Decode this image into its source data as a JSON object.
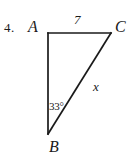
{
  "figure": {
    "problem_number": "4.",
    "shape": "right-triangle",
    "stroke_color": "#1a1a1a",
    "background_color": "#ffffff",
    "vertices": [
      {
        "name": "A",
        "label": "A",
        "x": 48,
        "y": 33,
        "position": "top-left"
      },
      {
        "name": "C",
        "label": "C",
        "x": 111,
        "y": 33,
        "position": "top-right"
      },
      {
        "name": "B",
        "label": "B",
        "x": 48,
        "y": 134,
        "position": "bottom-left"
      }
    ],
    "sides": [
      {
        "name": "AC",
        "from": "A",
        "to": "C",
        "label": "7",
        "known": true
      },
      {
        "name": "AB",
        "from": "A",
        "to": "B",
        "label": "",
        "known": false
      },
      {
        "name": "BC",
        "from": "B",
        "to": "C",
        "label": "x",
        "known": false
      }
    ],
    "angles": [
      {
        "at": "B",
        "label": "33",
        "degree_symbol": "°",
        "value": 33,
        "unit": "degrees"
      },
      {
        "at": "A",
        "label": "",
        "value": 90,
        "unit": "degrees",
        "marked": false
      }
    ],
    "labels": {
      "side_ac": "7",
      "side_bc": "x",
      "angle_b": "33°",
      "vertex_a": "A",
      "vertex_b": "B",
      "vertex_c": "C"
    }
  }
}
